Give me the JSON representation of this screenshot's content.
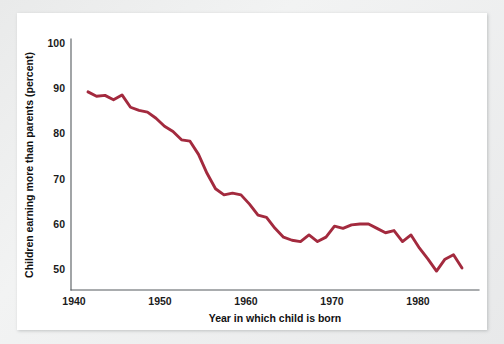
{
  "figure": {
    "background_color": "#ffffff",
    "page_color": "#ebecec"
  },
  "chart_data": {
    "type": "line",
    "title": "",
    "xlabel": "Year in which child is born",
    "ylabel": "Children earning more than parents (percent)",
    "xlim": [
      1938,
      1986
    ],
    "ylim": [
      46,
      103
    ],
    "xticks": [
      1940,
      1950,
      1960,
      1970,
      1980
    ],
    "xtick_labels": [
      "1940",
      "1950",
      "1960",
      "1970",
      "1980"
    ],
    "yticks": [
      50,
      60,
      70,
      80,
      90,
      100
    ],
    "ytick_labels": [
      "50",
      "60",
      "70",
      "80",
      "90",
      "100"
    ],
    "grid": false,
    "legend": false,
    "legend_position": "none",
    "series": [
      {
        "name": "Children earning more than parents",
        "color": "#a32a3e",
        "x": [
          1940,
          1941,
          1942,
          1943,
          1944,
          1945,
          1946,
          1947,
          1948,
          1949,
          1950,
          1951,
          1952,
          1953,
          1954,
          1955,
          1956,
          1957,
          1958,
          1959,
          1960,
          1961,
          1962,
          1963,
          1964,
          1965,
          1966,
          1967,
          1968,
          1969,
          1970,
          1971,
          1972,
          1973,
          1974,
          1975,
          1976,
          1977,
          1978,
          1979,
          1980,
          1981,
          1982,
          1983,
          1984
        ],
        "values": [
          91.0,
          90.0,
          90.2,
          89.2,
          90.3,
          87.5,
          86.8,
          86.4,
          85.0,
          83.2,
          82.0,
          80.1,
          79.8,
          76.8,
          72.5,
          69.0,
          67.6,
          68.0,
          67.6,
          65.5,
          63.0,
          62.5,
          60.0,
          58.0,
          57.3,
          57.0,
          58.5,
          57.0,
          58.0,
          60.5,
          60.0,
          60.8,
          61.0,
          61.0,
          60.0,
          59.0,
          59.5,
          57.0,
          58.5,
          55.5,
          53.0,
          50.3,
          53.0,
          54.0,
          51.0
        ]
      }
    ]
  },
  "axes": {
    "x_tick_positions_px": [
      74,
      160,
      246,
      332,
      418
    ],
    "y_tick_positions_px": [
      269,
      224,
      179,
      133,
      88,
      43
    ]
  }
}
